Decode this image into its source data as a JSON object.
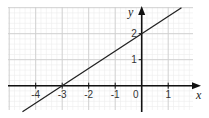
{
  "chart_data": {
    "type": "line",
    "title": "",
    "xlabel": "x",
    "ylabel": "y",
    "xlim": [
      -4.5,
      1.7
    ],
    "ylim": [
      -0.95,
      3.0
    ],
    "grid": true,
    "minor_grid_divisions": 5,
    "x_ticks": [
      -4,
      -3,
      -2,
      -1,
      0,
      1
    ],
    "x_tick_labels": [
      "-4",
      "-3",
      "-2",
      "-1",
      "0",
      "1"
    ],
    "y_ticks": [
      1,
      2
    ],
    "y_tick_labels": [
      "1",
      "2"
    ],
    "series": [
      {
        "name": "y = (2/3)x + 2",
        "slope": 0.6667,
        "intercept": 2,
        "x": [
          -4.5,
          1.5
        ],
        "y": [
          -1.0,
          3.0
        ],
        "points_of_interest": [
          {
            "x": -3,
            "y": 0,
            "label": "x-intercept"
          },
          {
            "x": 0,
            "y": 2,
            "label": "y-intercept"
          }
        ]
      }
    ],
    "colors": {
      "line": "#222222",
      "axes": "#111111",
      "major_grid": "#cfcfcf",
      "minor_grid": "#ececec"
    }
  }
}
